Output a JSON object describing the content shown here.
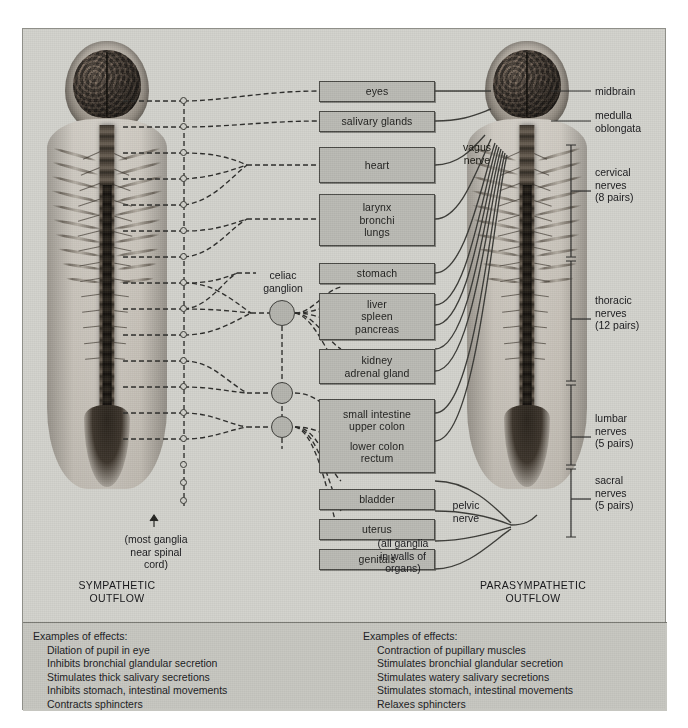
{
  "figure": {
    "background_color": "#d2d2cc",
    "border_color": "#8f8f89",
    "organ_box_fill": "#b9b9b3",
    "organ_box_border": "#4a4a46"
  },
  "columns": {
    "left_heading_line1": "SYMPATHETIC",
    "left_heading_line2": "OUTFLOW",
    "right_heading_line1": "PARASYMPATHETIC",
    "right_heading_line2": "OUTFLOW"
  },
  "organs": [
    {
      "id": "eyes",
      "lines": [
        "eyes"
      ]
    },
    {
      "id": "salivary-glands",
      "lines": [
        "salivary glands"
      ]
    },
    {
      "id": "heart",
      "lines": [
        "heart"
      ]
    },
    {
      "id": "larynx-bronchi-lungs",
      "lines": [
        "larynx",
        "bronchi",
        "lungs"
      ]
    },
    {
      "id": "stomach",
      "lines": [
        "stomach"
      ]
    },
    {
      "id": "liver-spleen-pancreas",
      "lines": [
        "liver",
        "spleen",
        "pancreas"
      ]
    },
    {
      "id": "kidney-adrenal",
      "lines": [
        "kidney",
        "adrenal gland"
      ]
    },
    {
      "id": "intestine-colon-rectum",
      "lines": [
        "small intestine",
        "upper colon",
        "",
        "lower colon",
        "rectum"
      ]
    },
    {
      "id": "bladder",
      "lines": [
        "bladder"
      ]
    },
    {
      "id": "uterus",
      "lines": [
        "uterus"
      ]
    },
    {
      "id": "genitals",
      "lines": [
        "genitals"
      ]
    }
  ],
  "annotations": {
    "celiac_ganglion": "celiac\nganglion",
    "most_ganglia": "(most ganglia\nnear spinal\ncord)",
    "all_ganglia": "(all ganglia\nin walls of\norgans)",
    "vagus_nerve": "vagus\nnerve",
    "pelvic_nerve": "pelvic\nnerve"
  },
  "anatomy_labels": [
    {
      "id": "midbrain",
      "text": "midbrain"
    },
    {
      "id": "medulla",
      "text": "medulla\noblongata"
    },
    {
      "id": "cervical",
      "text": "cervical\nnerves\n(8 pairs)"
    },
    {
      "id": "thoracic",
      "text": "thoracic\nnerves\n(12 pairs)"
    },
    {
      "id": "lumbar",
      "text": "lumbar\nnerves\n(5 pairs)"
    },
    {
      "id": "sacral",
      "text": "sacral\nnerves\n(5 pairs)"
    }
  ],
  "effects_left": {
    "heading": "Examples of effects:",
    "items": [
      "Dilation of pupil in eye",
      "Inhibits bronchial glandular secretion",
      "Stimulates thick salivary secretions",
      "Inhibits stomach, intestinal movements",
      "Contracts sphincters"
    ]
  },
  "effects_right": {
    "heading": "Examples of effects:",
    "items": [
      "Contraction of pupillary muscles",
      "Stimulates bronchial glandular secretion",
      "Stimulates watery salivary secretions",
      "Stimulates stomach, intestinal movements",
      "Relaxes sphincters"
    ]
  }
}
